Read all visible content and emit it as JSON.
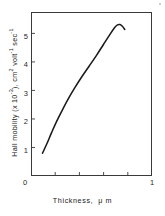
{
  "chart_data": {
    "type": "line",
    "title": "",
    "xlabel": "Thickness,  μ m",
    "ylabel": "Hall mobility (x 10-3), cm2 volt-1 sec-1",
    "ylabel_parts": {
      "lead": "Hall mobility (x 10",
      "exp1": "-3",
      "mid": "), cm",
      "exp2": "2",
      "mid2": " volt",
      "exp3": "-1",
      "mid3": " sec",
      "exp4": "-1"
    },
    "xlabel_parts": {
      "main": "Thickness,",
      "unit": "μ m"
    },
    "xlim": [
      0,
      1
    ],
    "ylim": [
      0,
      5.75
    ],
    "xticks": [
      0,
      1
    ],
    "xtick_labels": [
      "0",
      "1"
    ],
    "x_minor_ticks": [
      0.2,
      0.4,
      0.6,
      0.8
    ],
    "yticks": [
      1,
      2,
      3,
      4,
      5
    ],
    "ytick_labels": [
      "1",
      "2",
      "3",
      "4",
      "5"
    ],
    "y_origin_label": "0",
    "grid": false,
    "legend": false,
    "series": [
      {
        "name": "Hall mobility vs thickness",
        "color": "#1a1a1a",
        "x": [
          0.095,
          0.13,
          0.17,
          0.21,
          0.26,
          0.31,
          0.36,
          0.42,
          0.48,
          0.54,
          0.6,
          0.65,
          0.69,
          0.715,
          0.735,
          0.755,
          0.775
        ],
        "y": [
          0.8,
          1.12,
          1.52,
          1.9,
          2.32,
          2.72,
          3.08,
          3.48,
          3.85,
          4.22,
          4.62,
          4.95,
          5.2,
          5.3,
          5.31,
          5.25,
          5.14
        ]
      }
    ],
    "annotations": []
  },
  "figure": {
    "frame_color": "#3a3a3a",
    "background": "#ffffff",
    "curve_color": "#1a1a1a"
  }
}
